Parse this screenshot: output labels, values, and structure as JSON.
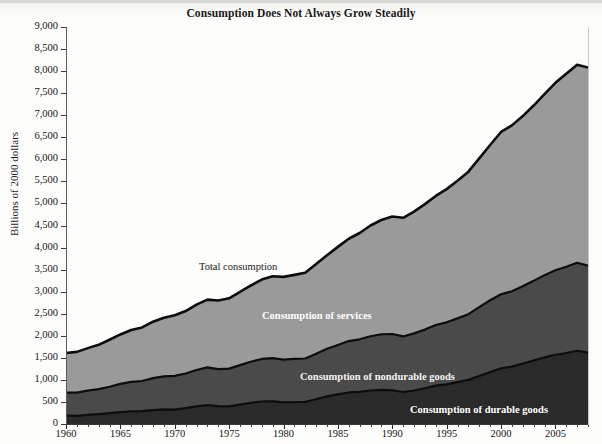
{
  "chart_title": "Consumption Does Not Always Grow Steadily",
  "axes": {
    "ylabel": "Billions of 2000 dollars",
    "ytick_labels": [
      "9,000",
      "8,500",
      "8,000",
      "7,500",
      "7,000",
      "6,500",
      "6,000",
      "5,500",
      "5,000",
      "4,500",
      "4,000",
      "3,500",
      "3,000",
      "2,500",
      "2,000",
      "1,500",
      "1,000",
      "500",
      "0"
    ],
    "xtick_labels": [
      "1960",
      "1965",
      "1970",
      "1975",
      "1980",
      "1985",
      "1990",
      "1995",
      "2000",
      "2005"
    ]
  },
  "series_labels": {
    "total": "Total consumption",
    "services": "Consumption of services",
    "nondurable": "Consumption of nondurable goods",
    "durable": "Consumption of durable goods"
  },
  "colors": {
    "services": "#9a9a9a",
    "nondurable": "#4a4a4a",
    "durable": "#2a2a2a",
    "outline": "#0d0d0d",
    "background": "#fdfdfc",
    "axis": "#3a3a3a"
  },
  "chart_data": {
    "type": "area",
    "title": "Consumption Does Not Always Grow Steadily",
    "xlabel": "",
    "ylabel": "Billions of 2000 dollars",
    "xlim": [
      1960,
      2008
    ],
    "ylim": [
      0,
      9000
    ],
    "ytick_step": 500,
    "grid": false,
    "legend": "inline-labels",
    "stacked": true,
    "note": "Stacked areas; Total consumption is the sum of the three bands (durable + nondurable + services).",
    "x": [
      1960,
      1961,
      1962,
      1963,
      1964,
      1965,
      1966,
      1967,
      1968,
      1969,
      1970,
      1971,
      1972,
      1973,
      1974,
      1975,
      1976,
      1977,
      1978,
      1979,
      1980,
      1981,
      1982,
      1983,
      1984,
      1985,
      1986,
      1987,
      1988,
      1989,
      1990,
      1991,
      1992,
      1993,
      1994,
      1995,
      1996,
      1997,
      1998,
      1999,
      2000,
      2001,
      2002,
      2003,
      2004,
      2005,
      2006,
      2007,
      2008
    ],
    "series": [
      {
        "name": "Consumption of durable goods",
        "values": [
          190,
          185,
          205,
          225,
          245,
          270,
          285,
          290,
          315,
          330,
          325,
          360,
          400,
          430,
          405,
          400,
          440,
          480,
          510,
          515,
          490,
          495,
          500,
          560,
          625,
          670,
          715,
          730,
          760,
          775,
          765,
          725,
          760,
          810,
          870,
          900,
          950,
          1000,
          1090,
          1180,
          1260,
          1300,
          1370,
          1440,
          1510,
          1570,
          1610,
          1660,
          1620
        ]
      },
      {
        "name": "Consumption of nondurable goods",
        "values": [
          520,
          525,
          550,
          565,
          600,
          640,
          670,
          685,
          725,
          750,
          765,
          785,
          825,
          855,
          840,
          855,
          895,
          930,
          965,
          980,
          970,
          980,
          985,
          1035,
          1080,
          1120,
          1165,
          1190,
          1230,
          1260,
          1275,
          1260,
          1295,
          1330,
          1375,
          1405,
          1445,
          1490,
          1560,
          1625,
          1680,
          1710,
          1755,
          1805,
          1865,
          1915,
          1955,
          1995,
          1970
        ]
      },
      {
        "name": "Consumption of services",
        "values": [
          900,
          925,
          965,
          1005,
          1065,
          1120,
          1175,
          1215,
          1280,
          1330,
          1375,
          1415,
          1480,
          1535,
          1555,
          1595,
          1660,
          1730,
          1800,
          1855,
          1875,
          1905,
          1945,
          2030,
          2120,
          2225,
          2320,
          2410,
          2510,
          2590,
          2665,
          2690,
          2760,
          2845,
          2925,
          3020,
          3120,
          3230,
          3370,
          3520,
          3680,
          3760,
          3855,
          3975,
          4105,
          4250,
          4375,
          4490,
          4490
        ]
      }
    ],
    "total": {
      "name": "Total consumption",
      "values": [
        1610,
        1635,
        1720,
        1795,
        1910,
        2030,
        2130,
        2190,
        2320,
        2410,
        2465,
        2560,
        2705,
        2820,
        2800,
        2850,
        2995,
        3140,
        3275,
        3350,
        3335,
        3380,
        3430,
        3625,
        3825,
        4015,
        4200,
        4330,
        4500,
        4625,
        4705,
        4675,
        4815,
        4985,
        5170,
        5325,
        5515,
        5720,
        6020,
        6325,
        6620,
        6770,
        6980,
        7220,
        7480,
        7735,
        7940,
        8145,
        8080
      ]
    }
  }
}
